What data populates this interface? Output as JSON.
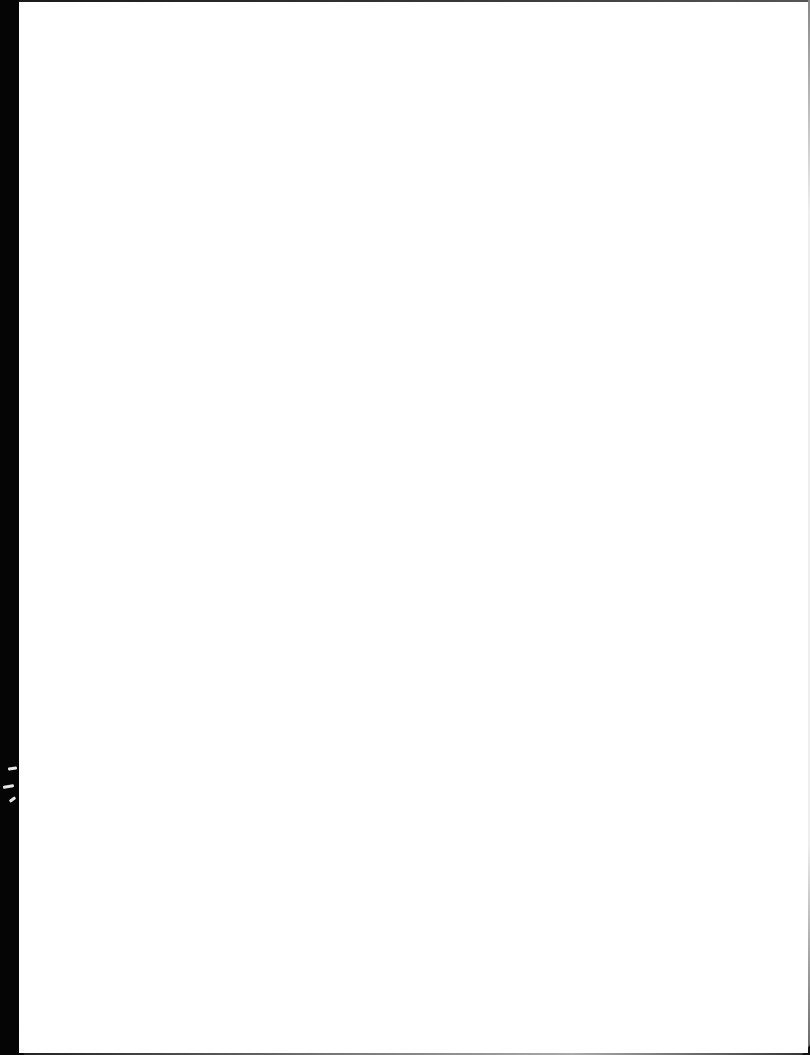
{
  "document": {
    "type": "scanned-page",
    "content": "",
    "page_color": "#ffffff",
    "scan_border_color": "#050505"
  }
}
